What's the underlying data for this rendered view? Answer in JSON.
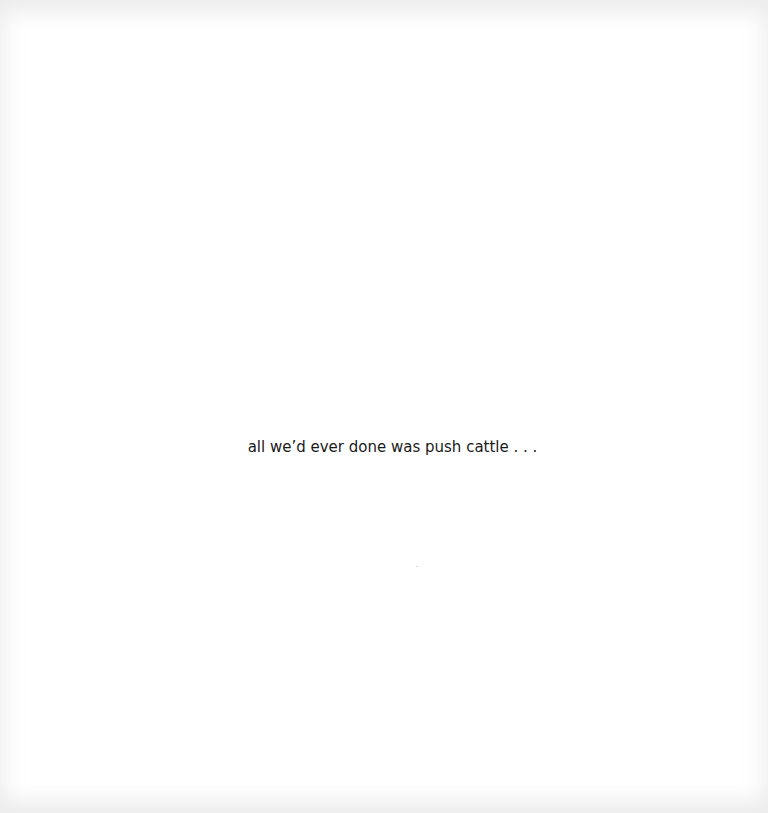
{
  "page": {
    "text": "all we’d ever done was push cattle . . ."
  }
}
